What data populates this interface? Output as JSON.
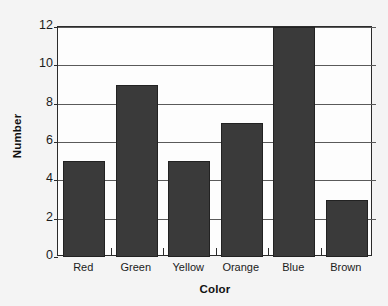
{
  "chart_data": {
    "type": "bar",
    "title": "",
    "xlabel": "Color",
    "ylabel": "Number",
    "categories": [
      "Red",
      "Green",
      "Yellow",
      "Orange",
      "Blue",
      "Brown"
    ],
    "values": [
      5,
      9,
      5,
      7,
      12,
      3
    ],
    "ylim": [
      0,
      12
    ],
    "ytick_labels": [
      "0",
      "2",
      "4",
      "6",
      "8",
      "10",
      "12"
    ],
    "ytick_values": [
      0,
      2,
      4,
      6,
      8,
      10,
      12
    ],
    "grid": true,
    "legend": false,
    "bar_color": "#3a3a3a",
    "axis_color": "#2b2b2b",
    "background_color": "#f4f4f4",
    "plot_background_color": "#fdfdfd"
  }
}
